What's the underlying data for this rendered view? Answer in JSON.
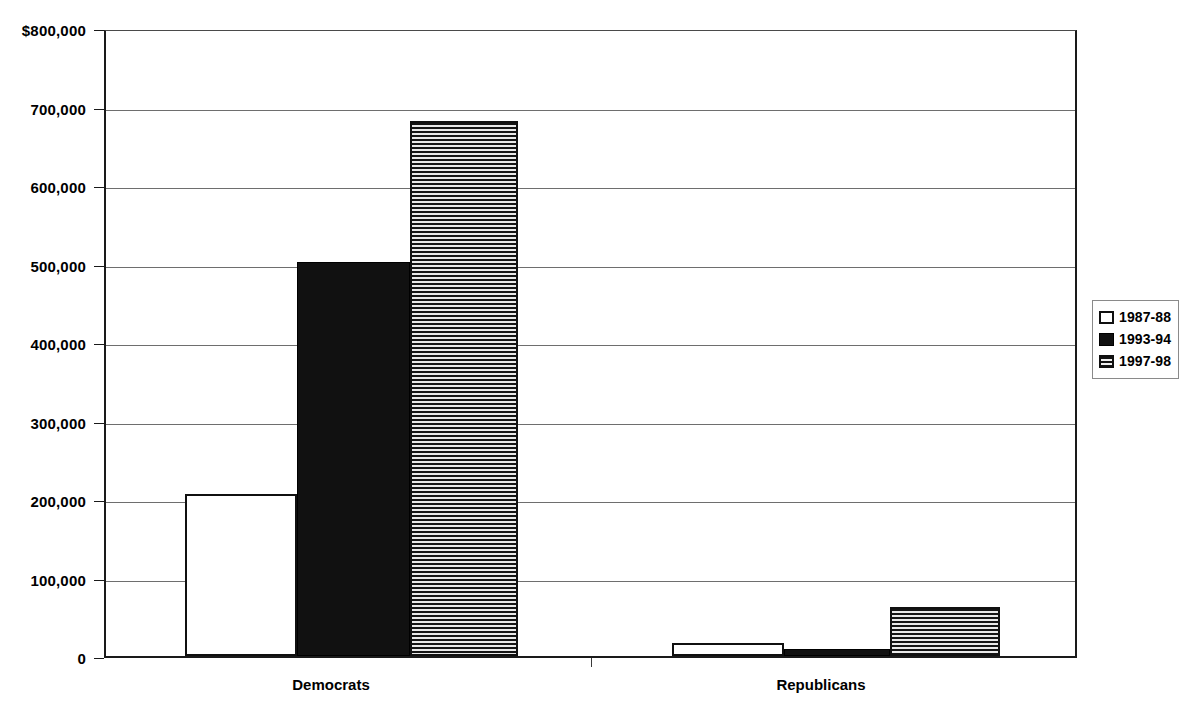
{
  "chart_data": {
    "type": "bar",
    "title": "",
    "subtitle": "",
    "xlabel": "",
    "ylabel": "",
    "categories": [
      "Democrats",
      "Republicans"
    ],
    "series": [
      {
        "name": "1987-88",
        "pattern": "open",
        "values": [
          206000,
          17000
        ]
      },
      {
        "name": "1993-94",
        "pattern": "solid",
        "values": [
          502000,
          9000
        ]
      },
      {
        "name": "1997-98",
        "pattern": "hatch",
        "values": [
          681000,
          63000
        ]
      }
    ],
    "ylim": [
      0,
      800000
    ],
    "ytick_values": [
      0,
      100000,
      200000,
      300000,
      400000,
      500000,
      600000,
      700000,
      800000
    ],
    "ytick_labels": [
      "0",
      "100,000",
      "200,000",
      "300,000",
      "400,000",
      "500,000",
      "600,000",
      "700,000",
      "$800,000"
    ],
    "grid": true,
    "legend_position": "right"
  },
  "legend": {
    "entries": [
      {
        "label": "1987-88"
      },
      {
        "label": "1993-94"
      },
      {
        "label": "1997-98"
      }
    ]
  },
  "axis": {
    "x_labels": [
      "Democrats",
      "Republicans"
    ]
  },
  "colors": {
    "axis": "#1a1a1a",
    "gridline": "#6e6e6e",
    "bar_solid": "#111111",
    "bar_open": "#ffffff",
    "bar_hatch_line": "#141414",
    "text": "#000000",
    "background": "#ffffff"
  }
}
